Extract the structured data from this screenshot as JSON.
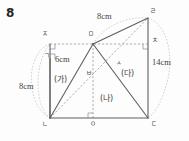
{
  "problem": {
    "number": "8"
  },
  "figure": {
    "type": "geometry-diagram",
    "stroke_color": "#6b6b6b",
    "solid_stroke_color": "#5a5a5a",
    "dashed_stroke_color": "#8c8c8c",
    "arc_stroke_color": "#a8a8a8",
    "background_color": "#fdfdfd"
  },
  "vertices": [
    {
      "name": "j-top-left",
      "label": "ㅈ",
      "x": 50,
      "y": 44,
      "lx": 42,
      "ly": 31
    },
    {
      "name": "m-top-middle",
      "label": "ㅁ",
      "x": 93,
      "y": 44,
      "lx": 88,
      "ly": 31
    },
    {
      "name": "ch-top-right",
      "label": "ㅊ",
      "x": 148,
      "y": 44,
      "lx": 152,
      "ly": 36
    },
    {
      "name": "r-apex",
      "label": "ㄹ",
      "x": 148,
      "y": 18,
      "lx": 150,
      "ly": 8
    },
    {
      "name": "n-bottom-left",
      "label": "ㄴ",
      "x": 50,
      "y": 118,
      "lx": 42,
      "ly": 121
    },
    {
      "name": "o-bottom-mid",
      "label": "ㅇ",
      "x": 93,
      "y": 118,
      "lx": 90,
      "ly": 121
    },
    {
      "name": "d-bottom-right",
      "label": "ㄷ",
      "x": 148,
      "y": 118,
      "lx": 151,
      "ly": 121
    },
    {
      "name": "b-interior",
      "label": "ㅂ",
      "x": 93,
      "y": 75,
      "lx": 86,
      "ly": 70
    },
    {
      "name": "s-interior",
      "label": "ㅅ",
      "x": 120,
      "y": 68,
      "lx": 116,
      "ly": 60
    },
    {
      "name": "g-left-mark",
      "label": "ㄱ",
      "x": 50,
      "y": 58,
      "lx": 44,
      "ly": 54
    }
  ],
  "dimensions": [
    {
      "name": "top-edge-length",
      "text": "8cm",
      "lx": 97,
      "ly": 14
    },
    {
      "name": "right-edge-length",
      "text": "14cm",
      "lx": 153,
      "ly": 62
    },
    {
      "name": "upper-left-length",
      "text": "6cm",
      "lx": 55,
      "ly": 57
    },
    {
      "name": "left-arc-length",
      "text": "8cm",
      "lx": 20,
      "ly": 84
    }
  ],
  "regions": [
    {
      "name": "region-ga",
      "text": "(가)",
      "lx": 56,
      "ly": 79
    },
    {
      "name": "region-na",
      "text": "(나)",
      "lx": 101,
      "ly": 98
    },
    {
      "name": "region-da",
      "text": "(다)",
      "lx": 122,
      "ly": 73
    }
  ]
}
